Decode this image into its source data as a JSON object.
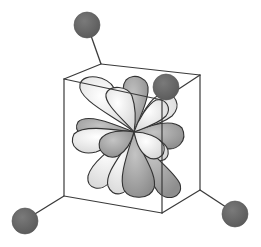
{
  "diagram": {
    "ligand_count": 4,
    "colors": {
      "ligand": "#6b6b6b",
      "lobe_light": "#f2f2f2",
      "lobe_dark": "#a9a9a9",
      "edge": "#3a3a3a",
      "background": "#ffffff"
    }
  }
}
